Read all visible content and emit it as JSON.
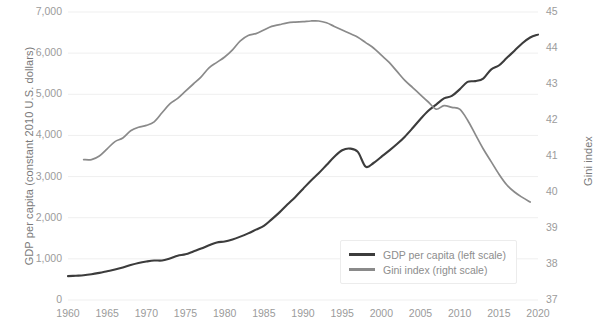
{
  "chart_data": {
    "type": "line",
    "title": "",
    "xlabel": "",
    "ylabel": "GDP per capita (constant 2010 U.S. dollars)",
    "ylabel_right": "Gini index",
    "xlim": [
      1960,
      2020
    ],
    "ylim": [
      0,
      7000
    ],
    "ylim_right": [
      37,
      45
    ],
    "grid": true,
    "legend_position": "inside-bottom-right",
    "x_ticks": [
      1960,
      1965,
      1970,
      1975,
      1980,
      1985,
      1990,
      1995,
      2000,
      2005,
      2010,
      2015,
      2020
    ],
    "x_tick_labels": [
      "1960",
      "1965",
      "1970",
      "1975",
      "1980",
      "1985",
      "1990",
      "1995",
      "2000",
      "2005",
      "2010",
      "2015",
      "2020"
    ],
    "y_ticks_left": [
      0,
      1000,
      2000,
      3000,
      4000,
      5000,
      6000,
      7000
    ],
    "y_tick_labels_left": [
      "0",
      "1,000",
      "2,000",
      "3,000",
      "4,000",
      "5,000",
      "6,000",
      "7,000"
    ],
    "y_ticks_right": [
      37,
      38,
      39,
      40,
      41,
      42,
      43,
      44,
      45
    ],
    "y_tick_labels_right": [
      "37",
      "38",
      "39",
      "40",
      "41",
      "42",
      "43",
      "44",
      "45"
    ],
    "colors": {
      "gdp": "#3c3c3c",
      "gini": "#8a8a8a",
      "grid": "#efefef",
      "tick_text": "#9b9b9b",
      "axis_title": "#7a7a7a",
      "background": "#ffffff"
    },
    "series": [
      {
        "name": "GDP per capita (left scale)",
        "axis": "left",
        "color": "#3c3c3c",
        "x": [
          1960,
          1961,
          1962,
          1963,
          1964,
          1965,
          1966,
          1967,
          1968,
          1969,
          1970,
          1971,
          1972,
          1973,
          1974,
          1975,
          1976,
          1977,
          1978,
          1979,
          1980,
          1981,
          1982,
          1983,
          1984,
          1985,
          1986,
          1987,
          1988,
          1989,
          1990,
          1991,
          1992,
          1993,
          1994,
          1995,
          1996,
          1997,
          1998,
          1999,
          2000,
          2001,
          2002,
          2003,
          2004,
          2005,
          2006,
          2007,
          2008,
          2009,
          2010,
          2011,
          2012,
          2013,
          2014,
          2015,
          2016,
          2017,
          2018,
          2019,
          2020
        ],
        "values": [
          580,
          590,
          600,
          625,
          660,
          700,
          740,
          790,
          850,
          900,
          935,
          960,
          960,
          1010,
          1075,
          1110,
          1180,
          1250,
          1330,
          1400,
          1420,
          1470,
          1540,
          1620,
          1710,
          1800,
          1960,
          2130,
          2320,
          2500,
          2700,
          2900,
          3080,
          3280,
          3480,
          3640,
          3680,
          3600,
          3240,
          3330,
          3480,
          3630,
          3790,
          3970,
          4180,
          4400,
          4600,
          4750,
          4900,
          4960,
          5120,
          5300,
          5320,
          5380,
          5600,
          5700,
          5880,
          6060,
          6240,
          6380,
          6450
        ]
      },
      {
        "name": "Gini index (right scale)",
        "axis": "right",
        "color": "#8a8a8a",
        "x": [
          1962,
          1963,
          1964,
          1965,
          1966,
          1967,
          1968,
          1969,
          1970,
          1971,
          1972,
          1973,
          1974,
          1975,
          1976,
          1977,
          1978,
          1979,
          1980,
          1981,
          1982,
          1983,
          1984,
          1985,
          1986,
          1987,
          1988,
          1989,
          1990,
          1991,
          1992,
          1993,
          1994,
          1995,
          1996,
          1997,
          1998,
          1999,
          2000,
          2001,
          2002,
          2003,
          2004,
          2005,
          2006,
          2007,
          2008,
          2009,
          2010,
          2011,
          2012,
          2013,
          2014,
          2015,
          2016,
          2017,
          2018,
          2019
        ],
        "values": [
          40.9,
          40.9,
          41.0,
          41.2,
          41.4,
          41.5,
          41.7,
          41.8,
          41.85,
          41.95,
          42.2,
          42.45,
          42.6,
          42.8,
          43.0,
          43.2,
          43.45,
          43.6,
          43.75,
          43.95,
          44.2,
          44.35,
          44.4,
          44.5,
          44.6,
          44.65,
          44.7,
          44.72,
          44.73,
          44.75,
          44.75,
          44.7,
          44.6,
          44.5,
          44.4,
          44.3,
          44.15,
          44.0,
          43.8,
          43.6,
          43.35,
          43.1,
          42.9,
          42.7,
          42.5,
          42.3,
          42.4,
          42.35,
          42.3,
          42.0,
          41.6,
          41.2,
          40.85,
          40.5,
          40.2,
          40.0,
          39.85,
          39.72
        ]
      }
    ]
  },
  "legend": {
    "items": [
      {
        "label": "GDP per capita (left scale)",
        "color": "#3c3c3c"
      },
      {
        "label": "Gini index (right scale)",
        "color": "#8a8a8a"
      }
    ]
  }
}
